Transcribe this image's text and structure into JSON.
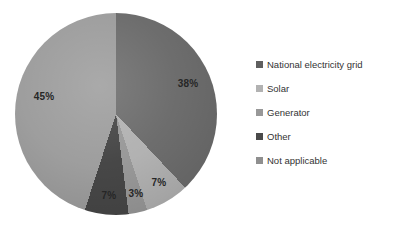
{
  "figure": {
    "background": "#ffffff"
  },
  "chart_data": {
    "type": "pie",
    "title": "",
    "categories": [
      "National electricity grid",
      "Solar",
      "Generator",
      "Other",
      "Not applicable"
    ],
    "values": [
      38,
      7,
      3,
      7,
      45
    ],
    "unit": "%",
    "slice_labels": [
      "38%",
      "7%",
      "3%",
      "7%",
      "45%"
    ],
    "colors": [
      "#6d6d6d",
      "#b2b2b2",
      "#999999",
      "#474747",
      "#9e9e9e"
    ],
    "legend_marker_colors": [
      "#5f5f5f",
      "#b2b2b2",
      "#989898",
      "#4a4a4a",
      "#8f8f8f"
    ],
    "legend_position": "right",
    "start_angle_deg": 0,
    "label_color": "#262626",
    "legend_text_color": "#333333"
  }
}
